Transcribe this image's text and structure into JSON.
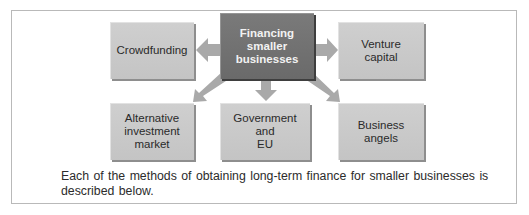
{
  "diagram": {
    "center": {
      "label_lines": [
        "Financing",
        "smaller",
        "businesses"
      ]
    },
    "nodes": [
      {
        "id": "crowdfunding",
        "label_lines": [
          "Crowdfunding"
        ]
      },
      {
        "id": "venture-capital",
        "label_lines": [
          "Venture",
          "capital"
        ]
      },
      {
        "id": "alternative-investment-market",
        "label_lines": [
          "Alternative",
          "investment",
          "market"
        ]
      },
      {
        "id": "government-and-eu",
        "label_lines": [
          "Government",
          "and",
          "EU"
        ]
      },
      {
        "id": "business-angels",
        "label_lines": [
          "Business",
          "angels"
        ]
      }
    ],
    "colors": {
      "center_fill": "#6f6f6f",
      "node_fill": "#c8c8c8",
      "arrow": "#a9a9a9",
      "frame": "#b9b9b9"
    }
  },
  "caption": {
    "line1": "Each of the methods of obtaining long-term finance for smaller businesses is",
    "line2": "described below."
  }
}
